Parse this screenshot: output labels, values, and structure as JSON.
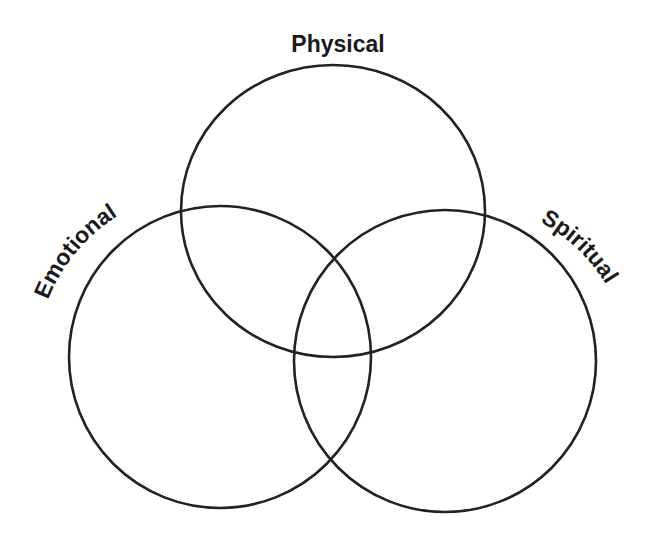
{
  "diagram": {
    "type": "venn",
    "sets": [
      {
        "id": "physical",
        "label": "Physical"
      },
      {
        "id": "emotional",
        "label": "Emotional"
      },
      {
        "id": "spiritual",
        "label": "Spiritual"
      }
    ],
    "stroke_color": "#222222",
    "background_color": "#ffffff"
  }
}
